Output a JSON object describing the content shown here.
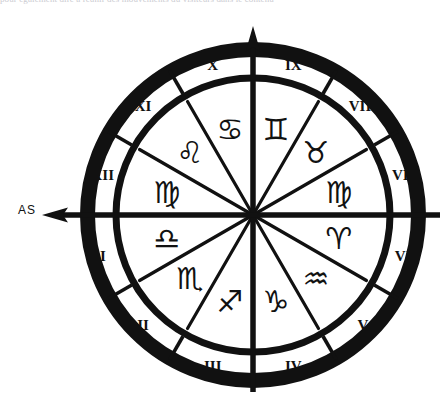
{
  "figure": {
    "top_text_fragment": "pour également dire à réunir des mouvements du visiteurs dans le contenu",
    "ascendant_label": "AS",
    "ink_color": "#111111",
    "background_color": "#ffffff",
    "center": {
      "x": 253,
      "y": 215
    },
    "radii": {
      "outer": 173,
      "band_inner": 142,
      "disc": 133
    },
    "axes": {
      "vertical": {
        "name": "midheaven-axis",
        "arrow": "up",
        "tip_y": 28
      },
      "horizontal": {
        "name": "ascendant-axis",
        "arrow": "left",
        "tip_x": 44
      }
    }
  },
  "houses": {
    "label": "Houses",
    "start_angle_deg": 180,
    "items": [
      {
        "numeral": "I",
        "angle_deg": 195
      },
      {
        "numeral": "II",
        "angle_deg": 225
      },
      {
        "numeral": "III",
        "angle_deg": 255
      },
      {
        "numeral": "IV",
        "angle_deg": 285
      },
      {
        "numeral": "V",
        "angle_deg": 315
      },
      {
        "numeral": "VI",
        "angle_deg": 345
      },
      {
        "numeral": "VII",
        "angle_deg": 15
      },
      {
        "numeral": "VIII",
        "angle_deg": 45
      },
      {
        "numeral": "IX",
        "angle_deg": 75
      },
      {
        "numeral": "X",
        "angle_deg": 105
      },
      {
        "numeral": "XI",
        "angle_deg": 135
      },
      {
        "numeral": "XII",
        "angle_deg": 165
      }
    ]
  },
  "zodiac": {
    "label": "Signs",
    "signs": [
      {
        "name": "virgo",
        "glyph": "♍",
        "angle_deg": 165
      },
      {
        "name": "leo",
        "glyph": "♌",
        "angle_deg": 135
      },
      {
        "name": "cancer",
        "glyph": "♋",
        "angle_deg": 105
      },
      {
        "name": "gemini",
        "glyph": "♊",
        "angle_deg": 75
      },
      {
        "name": "taurus",
        "glyph": "♉",
        "angle_deg": 45
      },
      {
        "name": "virgo-lower",
        "glyph": "♍",
        "angle_deg": 15
      },
      {
        "name": "aries",
        "glyph": "♈",
        "angle_deg": 345
      },
      {
        "name": "aquarius",
        "glyph": "♒",
        "angle_deg": 315
      },
      {
        "name": "capricorn",
        "glyph": "♑",
        "angle_deg": 285
      },
      {
        "name": "sagittarius",
        "glyph": "♐",
        "angle_deg": 255
      },
      {
        "name": "scorpio",
        "glyph": "♏",
        "angle_deg": 225
      },
      {
        "name": "libra",
        "glyph": "♎",
        "angle_deg": 195
      }
    ]
  }
}
